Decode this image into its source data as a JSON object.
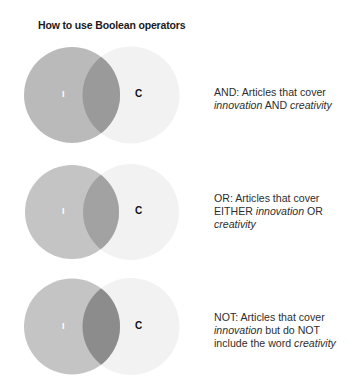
{
  "title": "How to use Boolean operators",
  "colors": {
    "circle_c": "#f2f2f2",
    "label_i": "#ffffff",
    "label_c": "#111111",
    "text": "#2e2e2e"
  },
  "diagrams": [
    {
      "operator": "AND",
      "circle_i_label": "I",
      "circle_c_label": "C",
      "circle_i_color": "#bababa",
      "overlap_color": "#9a9a9a",
      "description": {
        "p1": "AND: Articles that cover",
        "p2_em": "innovation",
        "p3": " AND ",
        "p4_em": "creativity",
        "p5": "",
        "p6_em": ""
      }
    },
    {
      "operator": "OR",
      "circle_i_label": "I",
      "circle_c_label": "C",
      "circle_i_color": "#c4c4c4",
      "overlap_color": "#a2a2a2",
      "description": {
        "p1": "OR: Articles that cover",
        "p2": "EITHER ",
        "p2_em": "innovation",
        "p3": " OR",
        "p4_em": "creativity"
      }
    },
    {
      "operator": "NOT",
      "circle_i_label": "I",
      "circle_c_label": "C",
      "circle_i_color": "#c4c4c4",
      "overlap_color": "#8c8c8c",
      "description": {
        "p1": "NOT: Articles that cover",
        "p2_em": "innovation",
        "p3": " but do NOT",
        "p4": "include the word ",
        "p4_em": "creativity"
      }
    }
  ]
}
